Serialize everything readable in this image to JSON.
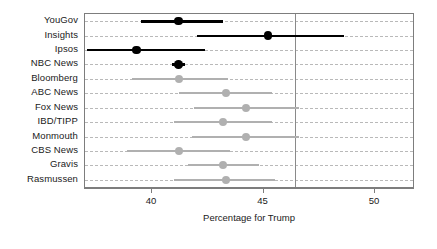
{
  "chart_data": {
    "type": "scatter",
    "subtype": "dot-plot-with-error-bars",
    "title": "",
    "subtitle": "",
    "xlabel": "Percentage for Trump",
    "ylabel": "",
    "xlim": [
      37.0,
      51.7
    ],
    "xticks": [
      40,
      45,
      50
    ],
    "xticklabels": [
      "40",
      "45",
      "50"
    ],
    "grid": "horizontal-dashed-per-category",
    "legend": "none",
    "categories": [
      "YouGov",
      "Insights",
      "Ipsos",
      "NBC News",
      "Bloomberg",
      "ABC News",
      "Fox News",
      "IBD/TIPP",
      "Monmouth",
      "CBS News",
      "Gravis",
      "Rasmussen"
    ],
    "annotations": [
      {
        "type": "vline",
        "x": 46.4,
        "label": "",
        "color": "#8a8a8a"
      }
    ],
    "series": [
      {
        "name": "Percentage for Trump",
        "points": [
          {
            "category": "YouGov",
            "value": 41.2,
            "low": 39.5,
            "high": 43.2,
            "style": "highlight"
          },
          {
            "category": "Insights",
            "value": 45.2,
            "low": 42.0,
            "high": 48.6,
            "style": "highlight"
          },
          {
            "category": "Ipsos",
            "value": 39.3,
            "low": 37.1,
            "high": 42.4,
            "style": "highlight"
          },
          {
            "category": "NBC News",
            "value": 41.2,
            "low": 40.9,
            "high": 41.5,
            "style": "highlight"
          },
          {
            "category": "Bloomberg",
            "value": 41.2,
            "low": 39.1,
            "high": 43.4,
            "style": "muted"
          },
          {
            "category": "ABC News",
            "value": 43.3,
            "low": 41.2,
            "high": 45.4,
            "style": "muted"
          },
          {
            "category": "Fox News",
            "value": 44.2,
            "low": 41.9,
            "high": 46.6,
            "style": "muted"
          },
          {
            "category": "IBD/TIPP",
            "value": 43.2,
            "low": 41.0,
            "high": 45.4,
            "style": "muted"
          },
          {
            "category": "Monmouth",
            "value": 44.2,
            "low": 41.8,
            "high": 46.6,
            "style": "muted"
          },
          {
            "category": "CBS News",
            "value": 41.2,
            "low": 38.9,
            "high": 43.5,
            "style": "muted"
          },
          {
            "category": "Gravis",
            "value": 43.2,
            "low": 41.6,
            "high": 44.8,
            "style": "muted"
          },
          {
            "category": "Rasmussen",
            "value": 43.3,
            "low": 41.0,
            "high": 45.5,
            "style": "muted"
          }
        ]
      }
    ],
    "colors": {
      "highlight": "#000000",
      "muted": "#b0b0b0",
      "gridline": "#b9b9b9",
      "panel_border": "#7d7d7d",
      "reference_line": "#8a8a8a",
      "background": "#ffffff",
      "text": "#1a1a1a"
    }
  }
}
